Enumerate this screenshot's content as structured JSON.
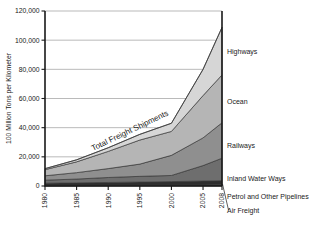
{
  "chart_data": {
    "type": "area",
    "title": "",
    "subtitle": "",
    "xlabel": "",
    "ylabel": "100 Million Tons per Kilometer",
    "xlim": [
      1980,
      2008
    ],
    "ylim": [
      0,
      120000
    ],
    "grid": true,
    "stacked": true,
    "legend_position": "right-inline",
    "x": [
      1980,
      1985,
      1990,
      1995,
      2000,
      2005,
      2008
    ],
    "xtick_labels": [
      "1980",
      "1985",
      "1990",
      "1995",
      "2000",
      "2005",
      "2008"
    ],
    "ytick_labels": [
      "0",
      "20,000",
      "40,000",
      "60,000",
      "80,000",
      "100,000",
      "120,000"
    ],
    "ytick_values": [
      0,
      20000,
      40000,
      60000,
      80000,
      100000,
      120000
    ],
    "series": [
      {
        "name": "Air Freight",
        "values": [
          200,
          260,
          330,
          420,
          520,
          700,
          850
        ],
        "color": "#1f1f1f",
        "label": "Air Freight"
      },
      {
        "name": "Petrol and Other Pipelines",
        "values": [
          1700,
          1900,
          2100,
          2300,
          2500,
          2700,
          2800
        ],
        "color": "#2e2e2e",
        "label": "Petrol and Other Pipelines"
      },
      {
        "name": "Inland Water Ways",
        "values": [
          2100,
          2600,
          3400,
          3900,
          4200,
          10600,
          15400
        ],
        "color": "#6e6e6e",
        "label": "Inland Water Ways"
      },
      {
        "name": "Railways",
        "values": [
          3000,
          4400,
          6100,
          8400,
          13800,
          19000,
          24300
        ],
        "color": "#8f8f8f",
        "label": "Railways"
      },
      {
        "name": "Ocean",
        "values": [
          4200,
          7400,
          11800,
          16500,
          16400,
          29000,
          32800
        ],
        "color": "#b5b5b5",
        "label": "Ocean"
      },
      {
        "name": "Highways",
        "values": [
          700,
          1400,
          2500,
          3900,
          5600,
          18000,
          32600
        ],
        "color": "#d6d6d6",
        "label": "Highways"
      }
    ],
    "totals": [
      11900,
      17960,
      26230,
      35420,
      43020,
      80000,
      108750
    ],
    "annotations": [
      {
        "text": "Total Freight Shipments",
        "type": "curve-label"
      }
    ]
  },
  "series_labels": {
    "highways": "Highways",
    "ocean": "Ocean",
    "railways": "Railways",
    "inland_water_ways": "Inland Water Ways",
    "petrol_and_other_pipelines": "Petrol and Other Pipelines",
    "air_freight": "Air Freight"
  },
  "annotation": {
    "total_curve": "Total Freight Shipments"
  },
  "axes": {
    "y_title": "100 Million Tons per Kilometer",
    "y_ticks": [
      "120,000",
      "100,000",
      "80,000",
      "60,000",
      "40,000",
      "20,000",
      "0"
    ],
    "x_ticks": [
      "1980",
      "1985",
      "1990",
      "1995",
      "2000",
      "2005",
      "2008"
    ]
  }
}
